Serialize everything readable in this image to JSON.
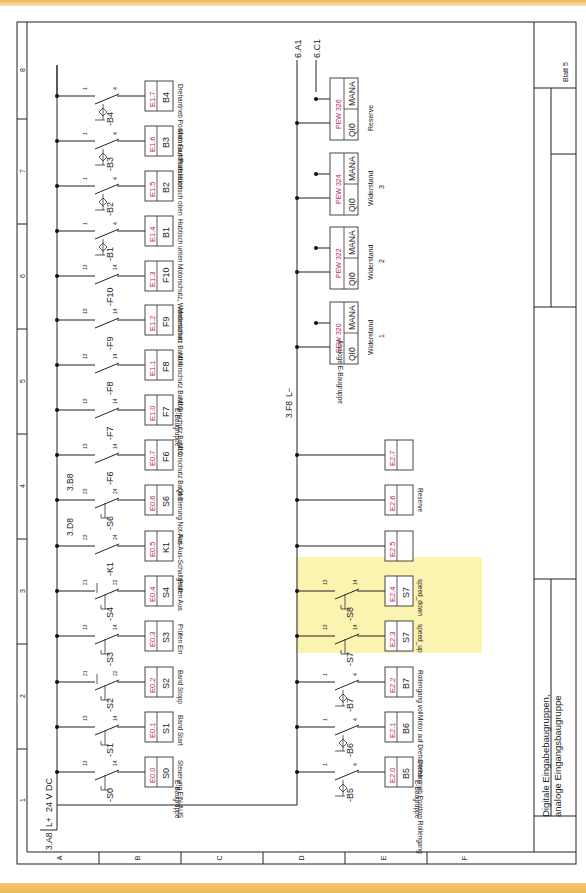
{
  "sheet": {
    "title_line1": "Digitale Eingabebaugruppen,",
    "title_line2": "analoge Eingangsbaugruppe",
    "sheet_label": "Blatt 5",
    "columns": [
      "1",
      "2",
      "3",
      "4",
      "5",
      "6",
      "7",
      "8"
    ],
    "rows": [
      "A",
      "B",
      "C",
      "D",
      "E",
      "F"
    ]
  },
  "supply": {
    "ref_in": "3.A8",
    "rail_label": "L+",
    "voltage": "24 V DC",
    "ref_l_minus": "3.F8",
    "l_minus_label": "L−",
    "out_refs": [
      "6.A1",
      "6.C1"
    ]
  },
  "group_labels": {
    "e_baugruppe": "E-Baugruppe",
    "analog_baugruppe": "Analoge E-Baugruppe",
    "reserve": "Reserve"
  },
  "row_b_inputs": [
    {
      "device": "-S0",
      "type": "pushbutton-latching",
      "pin_a": "13",
      "pin_b": "14",
      "address": "E0.0",
      "symbol": "S0",
      "description": "Steuerung EIN-AUS"
    },
    {
      "device": "-S1",
      "type": "pushbutton-no",
      "pin_a": "13",
      "pin_b": "14",
      "address": "E0.1",
      "symbol": "S1",
      "description": "Band Start"
    },
    {
      "device": "-S2",
      "type": "pushbutton-nc",
      "pin_a": "21",
      "pin_b": "22",
      "address": "E0.2",
      "symbol": "S2",
      "description": "Band Stopp"
    },
    {
      "device": "-S3",
      "type": "pushbutton-no",
      "pin_a": "13",
      "pin_b": "14",
      "address": "E0.3",
      "symbol": "S3",
      "description": "Prüfen Ein"
    },
    {
      "device": "-S4",
      "type": "pushbutton-nc",
      "pin_a": "21",
      "pin_b": "22",
      "address": "E0.4",
      "symbol": "S4",
      "description": "Prüfen Aus"
    },
    {
      "device": "-K1",
      "type": "contact-no",
      "pin_a": "23",
      "pin_b": "24",
      "address": "E0.5",
      "symbol": "K1",
      "description": "Not-Aus-Schaltgerät",
      "cross_ref": "3.D8"
    },
    {
      "device": "-S6",
      "type": "pushbutton-no",
      "pin_a": "23",
      "pin_b": "24",
      "address": "E0.6",
      "symbol": "S6",
      "description": "Quittierung Not-Aus",
      "cross_ref": "3.B8"
    },
    {
      "device": "-F6",
      "type": "contact-no",
      "pin_a": "13",
      "pin_b": "14",
      "address": "E0.7",
      "symbol": "F6",
      "description": "Motorschutz Band 1"
    },
    {
      "device": "-F7",
      "type": "contact-no",
      "pin_a": "13",
      "pin_b": "14",
      "address": "E1.0",
      "symbol": "F7",
      "description": "Motorschutz Band 2"
    },
    {
      "device": "-F8",
      "type": "contact-no",
      "pin_a": "13",
      "pin_b": "14",
      "address": "E1.1",
      "symbol": "F8",
      "description": "Motorschutz Band 3"
    },
    {
      "device": "-F9",
      "type": "contact-no",
      "pin_a": "13",
      "pin_b": "14",
      "address": "E1.2",
      "symbol": "F9",
      "description": "Motorschutz Band 4"
    },
    {
      "device": "-F10",
      "type": "contact-no",
      "pin_a": "13",
      "pin_b": "14",
      "address": "E1.3",
      "symbol": "F10",
      "description": "Motorschutz, Wendestation"
    },
    {
      "device": "-B1",
      "type": "proximity-sensor",
      "pin_a": "1",
      "pin_b": "4",
      "address": "E1.4",
      "symbol": "B1",
      "description": "Hubtisch unten"
    },
    {
      "device": "-B2",
      "type": "proximity-sensor",
      "pin_a": "1",
      "pin_b": "4",
      "address": "E1.5",
      "symbol": "B2",
      "description": "Hubtisch oben"
    },
    {
      "device": "-B3",
      "type": "proximity-sensor",
      "pin_a": "1",
      "pin_b": "4",
      "address": "E1.6",
      "symbol": "B3",
      "description": "Motor auf Prüfstation"
    },
    {
      "device": "-B4",
      "type": "proximity-sensor",
      "pin_a": "1",
      "pin_b": "4",
      "address": "E1.7",
      "symbol": "B4",
      "description": "Drehantrieb Position Bandfluss"
    }
  ],
  "row_d_inputs": [
    {
      "device": "-B5",
      "type": "proximity-sensor",
      "pin_a": "1",
      "pin_b": "4",
      "address": "E2.0",
      "symbol": "B5",
      "description": "Drehantrieb Position Rollengang"
    },
    {
      "device": "-B6",
      "type": "proximity-sensor",
      "pin_a": "1",
      "pin_b": "4",
      "address": "E2.1",
      "symbol": "B6",
      "description": "Motor auf Drehantrieb"
    },
    {
      "device": "-B7",
      "type": "proximity-sensor",
      "pin_a": "1",
      "pin_b": "4",
      "address": "E2.2",
      "symbol": "B7",
      "description": "Rollengang voll"
    },
    {
      "device": "-S7",
      "type": "pushbutton-no",
      "pin_a": "13",
      "pin_b": "14",
      "address": "E2.3",
      "symbol": "S7",
      "description": "speed_up",
      "highlight": true
    },
    {
      "device": "-S8",
      "type": "pushbutton-no",
      "pin_a": "13",
      "pin_b": "14",
      "address": "E2.4",
      "symbol": "S7",
      "description": "speed_down",
      "highlight": true
    },
    {
      "address": "E2.5",
      "symbol": "",
      "description": ""
    },
    {
      "address": "E2.6",
      "symbol": "",
      "description": "Reserve"
    },
    {
      "address": "E2.7",
      "symbol": "",
      "description": ""
    }
  ],
  "analog_inputs": [
    {
      "address": "PEW 320",
      "left": "QI0",
      "right": "MANA",
      "description_line1": "Widerstand",
      "description_line2": "1"
    },
    {
      "address": "PEW 322",
      "left": "QI0",
      "right": "MANA",
      "description_line1": "Widerstand",
      "description_line2": "2"
    },
    {
      "address": "PEW 324",
      "left": "QI0",
      "right": "MANA",
      "description_line1": "Widerstand",
      "description_line2": "3"
    },
    {
      "address": "PEW 326",
      "left": "QI0",
      "right": "MANA",
      "description_line1": "Reserve",
      "description_line2": ""
    }
  ],
  "colors": {
    "address_red": "#c2185b",
    "highlight": "#fbf3b0",
    "border_band": "#f0b653"
  }
}
